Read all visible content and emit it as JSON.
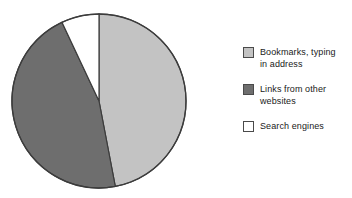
{
  "chart_data": {
    "type": "pie",
    "title": "",
    "categories": [
      "Bookmarks, typing in address",
      "Links from other websites",
      "Search engines"
    ],
    "values": [
      47,
      46,
      7
    ],
    "colors": [
      "#c3c3c3",
      "#6e6e6e",
      "#ffffff"
    ],
    "legend_position": "right",
    "grid": false,
    "start_angle_deg": 0,
    "direction": "clockwise",
    "slices": [
      {
        "label": "Bookmarks, typing in address",
        "value": 47,
        "color": "#c3c3c3",
        "start_deg": 0,
        "end_deg": 169.2
      },
      {
        "label": "Links from other websites",
        "value": 46,
        "color": "#6e6e6e",
        "start_deg": 169.2,
        "end_deg": 334.8
      },
      {
        "label": "Search engines",
        "value": 7,
        "color": "#ffffff",
        "start_deg": 334.8,
        "end_deg": 360
      }
    ],
    "outline_color": "#3c3c3c"
  },
  "legend": {
    "items": [
      {
        "swatch_name": "legend-swatch-bookmarks",
        "line1": "Bookmarks, typing",
        "line2": "in address",
        "color": "#c3c3c3"
      },
      {
        "swatch_name": "legend-swatch-links",
        "line1": "Links from other",
        "line2": "websites",
        "color": "#6e6e6e"
      },
      {
        "swatch_name": "legend-swatch-search",
        "line1": "Search engines",
        "line2": "",
        "color": "#ffffff"
      }
    ]
  }
}
